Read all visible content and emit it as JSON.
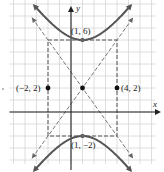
{
  "figure": {
    "type": "hyperbola-graph",
    "axes": {
      "x_label": "x",
      "y_label": "y"
    },
    "grid": {
      "x_min": -5,
      "x_max": 7,
      "y_min": -4,
      "y_max": 9,
      "px_per_unit_x": 11.5,
      "px_per_unit_y": 12,
      "origin_px": [
        71,
        112
      ]
    },
    "curve_color": "#555555",
    "asymptote_color": "#666666",
    "points": [
      {
        "label": "(1, 6)",
        "x": 1,
        "y": 6,
        "kind": "vertex"
      },
      {
        "label": "(1, −2)",
        "x": 1,
        "y": -2,
        "kind": "vertex"
      },
      {
        "label": "(−2, 2)",
        "x": -2,
        "y": 2,
        "kind": "co-vertex"
      },
      {
        "label": "(4, 2)",
        "x": 4,
        "y": 2,
        "kind": "co-vertex"
      },
      {
        "label": "",
        "x": 1,
        "y": 2,
        "kind": "center"
      }
    ],
    "hyperbola": {
      "center": [
        1,
        2
      ],
      "a": 4,
      "b": 3,
      "orientation": "vertical"
    }
  }
}
